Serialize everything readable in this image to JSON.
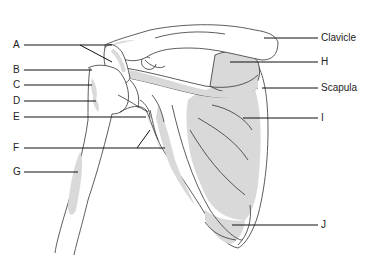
{
  "diagram": {
    "colors": {
      "bone_shade": "#d9d9d9",
      "outline": "#333333",
      "leader": "#111111"
    },
    "labels_left": [
      {
        "id": "A",
        "text": "A",
        "y": 45
      },
      {
        "id": "B",
        "text": "B",
        "y": 70
      },
      {
        "id": "C",
        "text": "C",
        "y": 85
      },
      {
        "id": "D",
        "text": "D",
        "y": 101
      },
      {
        "id": "E",
        "text": "E",
        "y": 117
      },
      {
        "id": "F",
        "text": "F",
        "y": 148
      },
      {
        "id": "G",
        "text": "G",
        "y": 172
      }
    ],
    "labels_right": [
      {
        "id": "clavicle",
        "text": "Clavicle",
        "y": 38
      },
      {
        "id": "H",
        "text": "H",
        "y": 62
      },
      {
        "id": "scapula",
        "text": "Scapula",
        "y": 88
      },
      {
        "id": "I",
        "text": "I",
        "y": 118
      },
      {
        "id": "J",
        "text": "J",
        "y": 225
      }
    ]
  }
}
